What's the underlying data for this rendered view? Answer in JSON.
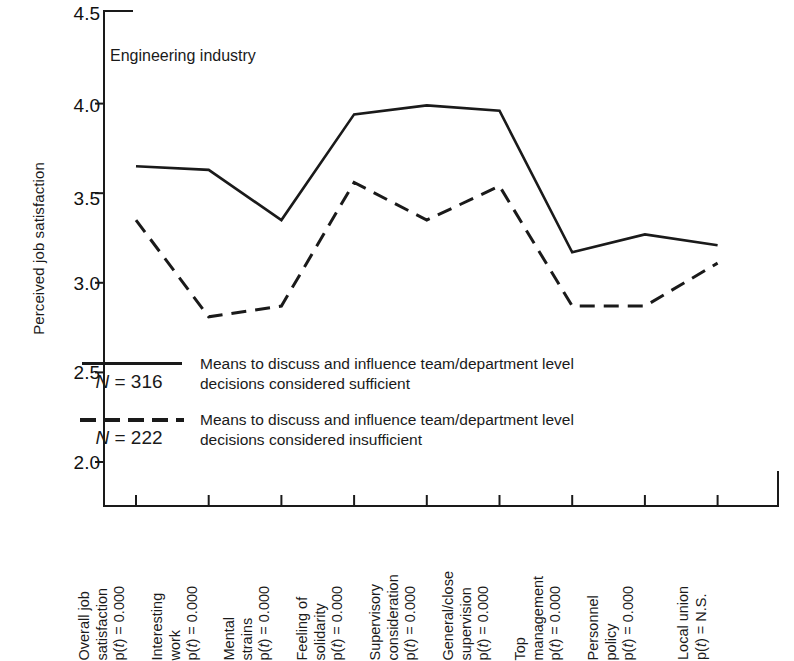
{
  "chart_data": {
    "type": "line",
    "title": "Engineering industry",
    "xlabel": "",
    "ylabel": "Perceived job satisfaction",
    "ylim": [
      2.0,
      4.5
    ],
    "yticks": [
      "2.0",
      "2.5",
      "3.0",
      "3.5",
      "4.0",
      "4.5"
    ],
    "grid": false,
    "legend_position": "inside-lower-left",
    "categories": [
      "Overall job satisfaction",
      "Interesting work",
      "Mental strains",
      "Feeling of solidarity",
      "Supervisory consideration",
      "General/close supervision",
      "Top management",
      "Personnel policy",
      "Local union"
    ],
    "category_significance": [
      "p(t) = 0.000",
      "p(t) = 0.000",
      "p(t) = 0.000",
      "p(t) = 0.000",
      "p(t) = 0.000",
      "p(t) = 0.000",
      "p(t) = 0.000",
      "p(t) = 0.000",
      "p(t) = N.S."
    ],
    "series": [
      {
        "name": "Means to discuss and influence team/department level decisions considered sufficient",
        "style": "solid",
        "n_label": "N = 316",
        "values": [
          3.65,
          3.63,
          3.35,
          3.94,
          3.99,
          3.96,
          3.17,
          3.27,
          3.21
        ]
      },
      {
        "name": "Means to discuss and influence team/department level decisions considered insufficient",
        "style": "dashed",
        "n_label": "N = 222",
        "values": [
          3.35,
          2.81,
          2.87,
          3.56,
          3.35,
          3.54,
          2.87,
          2.87,
          3.11
        ]
      }
    ]
  },
  "axis": {
    "y_title": "Perceived job satisfaction",
    "y_ticks": [
      "4.5",
      "4.0",
      "3.5",
      "3.0",
      "2.5",
      "2.0"
    ]
  },
  "annotation": {
    "plot_title": "Engineering industry"
  },
  "legend": {
    "rows": [
      {
        "n_prefix": "N",
        "n_value": " = 316",
        "line1": "Means to discuss and influence team/department level",
        "line2": "decisions considered sufficient",
        "style": "solid"
      },
      {
        "n_prefix": "N",
        "n_value": " = 222",
        "line1": "Means to discuss and influence team/department level",
        "line2": "decisions considered insufficient",
        "style": "dashed"
      }
    ]
  },
  "xlabels": [
    {
      "l1": "Overall job",
      "l2": "satisfaction",
      "p_prefix": "p(",
      "p_var": "t",
      "p_suffix": ") = 0.000"
    },
    {
      "l1": "Interesting",
      "l2": "work",
      "p_prefix": "p(",
      "p_var": "t",
      "p_suffix": ") = 0.000"
    },
    {
      "l1": "Mental",
      "l2": "strains",
      "p_prefix": "p(",
      "p_var": "t",
      "p_suffix": ") = 0.000"
    },
    {
      "l1": "Feeling of",
      "l2": "solidarity",
      "p_prefix": "p(",
      "p_var": "t",
      "p_suffix": ") = 0.000"
    },
    {
      "l1": "Supervisory",
      "l2": "consideration",
      "p_prefix": "p(",
      "p_var": "t",
      "p_suffix": ") = 0.000"
    },
    {
      "l1": "General/close",
      "l2": "supervision",
      "p_prefix": "p(",
      "p_var": "t",
      "p_suffix": ") = 0.000"
    },
    {
      "l1": "Top",
      "l2": "management",
      "p_prefix": "p(",
      "p_var": "t",
      "p_suffix": ") = 0.000"
    },
    {
      "l1": "Personnel",
      "l2": "policy",
      "p_prefix": "p(",
      "p_var": "t",
      "p_suffix": ") = 0.000"
    },
    {
      "l1": "Local union",
      "l2": "",
      "p_prefix": "p(",
      "p_var": "t",
      "p_suffix": ") = N.S."
    }
  ],
  "colors": {
    "ink": "#1a1a1a",
    "background": "#ffffff"
  }
}
